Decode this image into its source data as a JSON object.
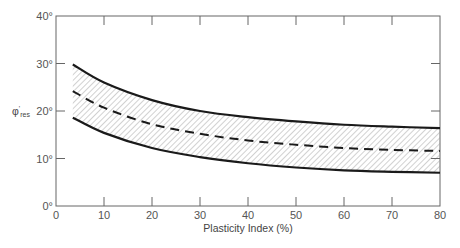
{
  "chart_data": {
    "type": "line",
    "title": "",
    "xlabel": "Plasticity Index (%)",
    "ylabel": "φ'res",
    "ylabel_main": "φ",
    "ylabel_sup": "'",
    "ylabel_sub": "res",
    "xlim": [
      0,
      80
    ],
    "ylim": [
      0,
      40
    ],
    "grid": false,
    "x_ticks": [
      0,
      10,
      20,
      30,
      40,
      50,
      60,
      70,
      80
    ],
    "x_tick_labels": [
      "0",
      "10",
      "20",
      "30",
      "40",
      "50",
      "60",
      "70",
      "80"
    ],
    "y_ticks": [
      0,
      10,
      20,
      30,
      40
    ],
    "y_tick_labels": [
      "0°",
      "10°",
      "20°",
      "30°",
      "40°"
    ],
    "x": [
      3.5,
      10,
      20,
      30,
      40,
      50,
      60,
      70,
      80
    ],
    "series": [
      {
        "name": "Upper bound",
        "style": "solid",
        "values": [
          29.8,
          26.0,
          22.3,
          20.0,
          18.7,
          17.8,
          17.1,
          16.7,
          16.4
        ]
      },
      {
        "name": "Mean",
        "style": "dashed",
        "values": [
          24.2,
          20.7,
          17.2,
          15.2,
          13.8,
          12.9,
          12.2,
          11.8,
          11.6
        ]
      },
      {
        "name": "Lower bound",
        "style": "solid",
        "values": [
          18.6,
          15.4,
          12.2,
          10.3,
          9.0,
          8.1,
          7.5,
          7.2,
          7.0
        ]
      }
    ],
    "band": {
      "between": [
        "Upper bound",
        "Lower bound"
      ],
      "fill": "hatched"
    }
  }
}
